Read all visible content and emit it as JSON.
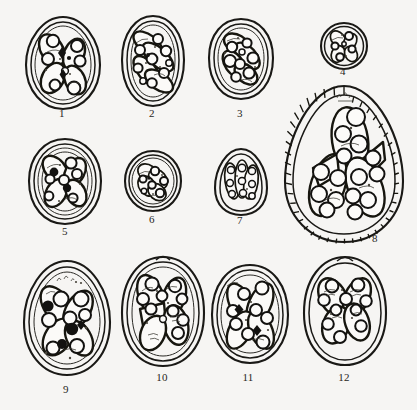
{
  "plate": {
    "title": "Plate of coccidian oocysts",
    "description": "Line-drawing plate showing twelve numbered oocyst specimens arranged in three rows.",
    "background_color": "#f6f5f3",
    "ink_color": "#1a1916",
    "width": 417,
    "height": 410
  },
  "figures": [
    {
      "id": 1,
      "label": "1",
      "shape": "ovoid",
      "label_x": 62,
      "label_y": 113,
      "cx": 62,
      "cy": 62,
      "rx": 38,
      "ry": 47,
      "wall_layers": 2,
      "sporocyst_count": 4,
      "has_micropyle": false,
      "wall_striated": false
    },
    {
      "id": 2,
      "label": "2",
      "shape": "elongate-oval",
      "label_x": 152,
      "label_y": 113,
      "cx": 152,
      "cy": 60,
      "rx": 32,
      "ry": 45,
      "wall_layers": 2,
      "sporocyst_count": 4,
      "has_micropyle": false,
      "wall_striated": false
    },
    {
      "id": 3,
      "label": "3",
      "shape": "broad-oval",
      "label_x": 240,
      "label_y": 113,
      "cx": 240,
      "cy": 58,
      "rx": 33,
      "ry": 40,
      "wall_layers": 2,
      "sporocyst_count": 4,
      "has_micropyle": false,
      "wall_striated": false
    },
    {
      "id": 4,
      "label": "4",
      "shape": "spherical",
      "label_x": 343,
      "label_y": 72,
      "cx": 343,
      "cy": 45,
      "rx": 22,
      "ry": 22,
      "wall_layers": 2,
      "sporocyst_count": 4,
      "has_micropyle": false,
      "wall_striated": false
    },
    {
      "id": 5,
      "label": "5",
      "shape": "broad-oval",
      "label_x": 65,
      "label_y": 231,
      "cx": 65,
      "cy": 181,
      "rx": 37,
      "ry": 42,
      "wall_layers": 3,
      "sporocyst_count": 4,
      "has_micropyle": false,
      "wall_striated": false
    },
    {
      "id": 6,
      "label": "6",
      "shape": "subspherical",
      "label_x": 152,
      "label_y": 220,
      "cx": 152,
      "cy": 181,
      "rx": 28,
      "ry": 31,
      "wall_layers": 2,
      "sporocyst_count": 4,
      "has_micropyle": false,
      "wall_striated": false
    },
    {
      "id": 7,
      "label": "7",
      "shape": "pyriform",
      "label_x": 240,
      "label_y": 221,
      "cx": 240,
      "cy": 180,
      "rx": 26,
      "ry": 32,
      "wall_layers": 2,
      "sporocyst_count": 4,
      "has_micropyle": false,
      "wall_striated": false
    },
    {
      "id": 8,
      "label": "8",
      "shape": "pyriform-large",
      "label_x": 375,
      "label_y": 238,
      "cx": 343,
      "cy": 163,
      "rx": 57,
      "ry": 78,
      "wall_layers": 2,
      "sporocyst_count": 4,
      "has_micropyle": true,
      "wall_striated": true
    },
    {
      "id": 9,
      "label": "9",
      "shape": "ovoid",
      "label_x": 66,
      "label_y": 390,
      "cx": 66,
      "cy": 318,
      "rx": 43,
      "ry": 57,
      "wall_layers": 3,
      "sporocyst_count": 4,
      "has_micropyle": false,
      "wall_striated": false
    },
    {
      "id": 10,
      "label": "10",
      "shape": "oval-with-cap",
      "label_x": 162,
      "label_y": 378,
      "cx": 162,
      "cy": 313,
      "rx": 40,
      "ry": 54,
      "wall_layers": 3,
      "sporocyst_count": 4,
      "has_micropyle": true,
      "wall_striated": false
    },
    {
      "id": 11,
      "label": "11",
      "shape": "oval",
      "label_x": 248,
      "label_y": 378,
      "cx": 248,
      "cy": 312,
      "rx": 38,
      "ry": 48,
      "wall_layers": 2,
      "sporocyst_count": 4,
      "has_micropyle": false,
      "wall_striated": false
    },
    {
      "id": 12,
      "label": "12",
      "shape": "oval-with-cap",
      "label_x": 344,
      "label_y": 378,
      "cx": 344,
      "cy": 311,
      "rx": 41,
      "ry": 53,
      "wall_layers": 2,
      "sporocyst_count": 4,
      "has_micropyle": true,
      "wall_striated": false
    }
  ]
}
